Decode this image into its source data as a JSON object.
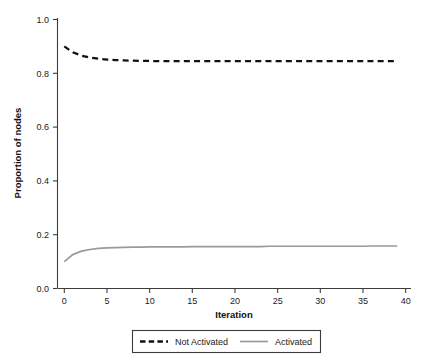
{
  "chart_data": {
    "type": "line",
    "title": "",
    "xlabel": "Iteration",
    "ylabel": "Proportion of nodes",
    "xlim": [
      -1,
      40
    ],
    "ylim": [
      0.0,
      1.0
    ],
    "xticks": [
      "0",
      "5",
      "10",
      "15",
      "20",
      "25",
      "30",
      "35",
      "40"
    ],
    "xtick_values": [
      0,
      5,
      10,
      15,
      20,
      25,
      30,
      35,
      40
    ],
    "yticks": [
      "0.0",
      "0.2",
      "0.4",
      "0.6",
      "0.8",
      "1.0"
    ],
    "ytick_values": [
      0.0,
      0.2,
      0.4,
      0.6,
      0.8,
      1.0
    ],
    "grid": false,
    "legend_position": "below-axes",
    "series": [
      {
        "name": "Not Activated",
        "style": "dashed",
        "color": "#111111",
        "x": [
          0,
          1,
          2,
          3,
          4,
          5,
          6,
          7,
          8,
          9,
          10,
          11,
          12,
          13,
          14,
          15,
          16,
          17,
          18,
          19,
          20,
          21,
          22,
          23,
          24,
          25,
          26,
          27,
          28,
          29,
          30,
          31,
          32,
          33,
          34,
          35,
          36,
          37,
          38,
          39
        ],
        "values": [
          0.9,
          0.878,
          0.866,
          0.858,
          0.854,
          0.851,
          0.849,
          0.848,
          0.847,
          0.846,
          0.846,
          0.845,
          0.845,
          0.845,
          0.845,
          0.845,
          0.845,
          0.845,
          0.845,
          0.845,
          0.845,
          0.845,
          0.845,
          0.845,
          0.845,
          0.845,
          0.845,
          0.845,
          0.845,
          0.845,
          0.845,
          0.845,
          0.845,
          0.845,
          0.845,
          0.845,
          0.845,
          0.845,
          0.845,
          0.845
        ]
      },
      {
        "name": "Activated",
        "style": "solid",
        "color": "#9a9a9a",
        "x": [
          0,
          1,
          2,
          3,
          4,
          5,
          6,
          7,
          8,
          9,
          10,
          11,
          12,
          13,
          14,
          15,
          16,
          17,
          18,
          19,
          20,
          21,
          22,
          23,
          24,
          25,
          26,
          27,
          28,
          29,
          30,
          31,
          32,
          33,
          34,
          35,
          36,
          37,
          38,
          39
        ],
        "values": [
          0.1,
          0.126,
          0.139,
          0.145,
          0.149,
          0.151,
          0.152,
          0.153,
          0.154,
          0.154,
          0.155,
          0.155,
          0.155,
          0.155,
          0.155,
          0.156,
          0.156,
          0.156,
          0.156,
          0.156,
          0.156,
          0.156,
          0.156,
          0.156,
          0.157,
          0.157,
          0.157,
          0.157,
          0.157,
          0.157,
          0.157,
          0.157,
          0.157,
          0.157,
          0.157,
          0.157,
          0.158,
          0.158,
          0.158,
          0.158
        ]
      }
    ]
  },
  "legend": {
    "entries": [
      {
        "label": "Not Activated",
        "style": "dashed",
        "color": "#111111"
      },
      {
        "label": "Activated",
        "style": "solid",
        "color": "#9a9a9a"
      }
    ]
  },
  "axes": {
    "x_title": "Iteration",
    "y_title": "Proportion of nodes"
  },
  "colors": {
    "background": "#ffffff",
    "axis": "#3c3c3c",
    "not_activated": "#111111",
    "activated": "#9a9a9a"
  }
}
